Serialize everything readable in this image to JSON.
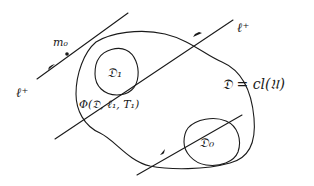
{
  "diagram": {
    "type": "hand-drawn mathematical sketch",
    "labels": {
      "point_m0": "m₀",
      "trajectory_top_right": "ℓ⁺",
      "trajectory_left": "ℓ⁺",
      "region_D1": "𝔇₁",
      "region_D0": "𝔇₀",
      "neighborhood": "Φ(𝔇, ℓ₁, T₁)",
      "domain_equation": "𝔇 = cl(𝔘)"
    },
    "elements": [
      {
        "id": "line-through-m0",
        "kind": "directed line",
        "has_point": "m₀"
      },
      {
        "id": "line-through-D1",
        "kind": "directed line",
        "label": "ℓ⁺"
      },
      {
        "id": "line-through-D0",
        "kind": "directed line"
      },
      {
        "id": "outer-region",
        "kind": "closed curve",
        "label": "Φ(𝔇, ℓ₁, T₁)"
      },
      {
        "id": "region-D1",
        "kind": "closed curve",
        "label": "𝔇₁"
      },
      {
        "id": "region-D0",
        "kind": "closed curve",
        "label": "𝔇₀"
      }
    ],
    "colors": {
      "ink": "#1a1a1a",
      "background": "#ffffff"
    }
  }
}
